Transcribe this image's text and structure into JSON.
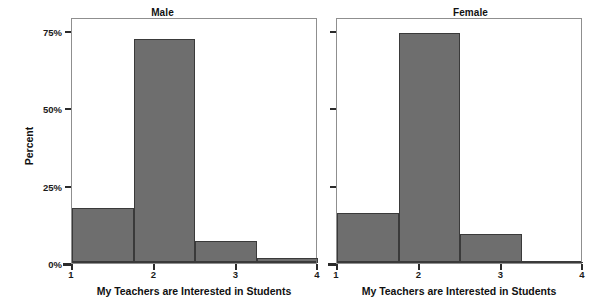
{
  "chart_data": {
    "type": "bar",
    "title": "",
    "subtitle": "",
    "xlabel": "My Teachers are Interested in Students",
    "ylabel": "Percent",
    "xlim": [
      1,
      4
    ],
    "ylim": [
      0,
      78
    ],
    "xticks": [
      "1",
      "2",
      "3",
      "4"
    ],
    "xtick_values": [
      1,
      2,
      3,
      4
    ],
    "yticks": [
      "0%",
      "25%",
      "50%",
      "75%"
    ],
    "ytick_values": [
      0,
      25,
      50,
      75
    ],
    "grid": false,
    "legend": "none",
    "bin_edges": [
      1,
      1.75,
      2.5,
      3.25,
      4
    ],
    "bar_color": "#6e6e6e",
    "bar_edge_color": "#3a3a3a",
    "axis_color": "#8f8f8f",
    "panels": [
      {
        "name": "male-panel",
        "title": "Male",
        "values": [
          17.8,
          72.5,
          7.0,
          1.6
        ]
      },
      {
        "name": "female-panel",
        "title": "Female",
        "values": [
          16.2,
          74.5,
          9.4,
          0.4
        ]
      }
    ]
  },
  "figure": {
    "panel_titles": {
      "male": "Male",
      "female": "Female"
    },
    "axis_titles": {
      "x": "My Teachers are Interested in Students",
      "y": "Percent"
    },
    "y_tick_labels": {
      "t0": "0%",
      "t25": "25%",
      "t50": "50%",
      "t75": "75%"
    },
    "x_tick_labels": {
      "t1": "1",
      "t2": "2",
      "t3": "3",
      "t4": "4"
    }
  }
}
